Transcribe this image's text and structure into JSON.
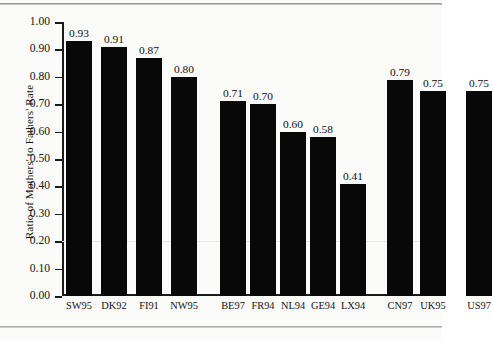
{
  "figure": {
    "ylabel": "Ratio of Mothers' to Fathers' Rate",
    "bar_color": "#080808",
    "axis_color": "#1b1b1b",
    "background": "#fbfbf9"
  },
  "chart_data": {
    "type": "bar",
    "title": "",
    "subtitle": "",
    "xlabel": "",
    "ylabel": "Ratio of Mothers' to Fathers' Rate",
    "ylim": [
      0.0,
      1.0
    ],
    "ytick_labels": [
      "1.00",
      "0.90",
      "0.80",
      "0.70",
      "0.60",
      "0.50",
      "0.40",
      "0.30",
      "0.20",
      "0.10",
      "0.00"
    ],
    "ytick_values": [
      1.0,
      0.9,
      0.8,
      0.7,
      0.6,
      0.5,
      0.4,
      0.3,
      0.2,
      0.1,
      0.0
    ],
    "grid": false,
    "legend": "none",
    "categories": [
      "SW95",
      "DK92",
      "FI91",
      "NW95",
      "BE97",
      "FR94",
      "NL94",
      "GE94",
      "LX94",
      "CN97",
      "UK95",
      "US97"
    ],
    "values": [
      0.93,
      0.91,
      0.87,
      0.8,
      0.71,
      0.7,
      0.6,
      0.58,
      0.41,
      0.79,
      0.75,
      0.75
    ],
    "value_labels": [
      "0.93",
      "0.91",
      "0.87",
      "0.80",
      "0.71",
      "0.70",
      "0.60",
      "0.58",
      "0.41",
      "0.79",
      "0.75",
      "0.75"
    ],
    "groups": [
      {
        "name": "nordic",
        "members": [
          "SW95",
          "DK92",
          "FI91",
          "NW95"
        ]
      },
      {
        "name": "continental",
        "members": [
          "BE97",
          "FR94",
          "NL94",
          "GE94",
          "LX94"
        ]
      },
      {
        "name": "anglo",
        "members": [
          "CN97",
          "UK95",
          "US97"
        ]
      }
    ],
    "bars": [
      {
        "category": "SW95",
        "value": 0.93,
        "label": "0.93",
        "x": 4,
        "width": 26
      },
      {
        "category": "DK92",
        "value": 0.91,
        "label": "0.91",
        "x": 39,
        "width": 26
      },
      {
        "category": "FI91",
        "value": 0.87,
        "label": "0.87",
        "x": 74,
        "width": 26
      },
      {
        "category": "NW95",
        "value": 0.8,
        "label": "0.80",
        "x": 109,
        "width": 26
      },
      {
        "category": "BE97",
        "value": 0.71,
        "label": "0.71",
        "x": 158,
        "width": 26
      },
      {
        "category": "FR94",
        "value": 0.7,
        "label": "0.70",
        "x": 188,
        "width": 26
      },
      {
        "category": "NL94",
        "value": 0.6,
        "label": "0.60",
        "x": 218,
        "width": 26
      },
      {
        "category": "GE94",
        "value": 0.58,
        "label": "0.58",
        "x": 248,
        "width": 26
      },
      {
        "category": "LX94",
        "value": 0.41,
        "label": "0.41",
        "x": 278,
        "width": 26
      },
      {
        "category": "CN97",
        "value": 0.79,
        "label": "0.79",
        "x": 325,
        "width": 26
      },
      {
        "category": "UK95",
        "value": 0.75,
        "label": "0.75",
        "x": 358,
        "width": 26
      },
      {
        "category": "US97",
        "value": 0.75,
        "label": "0.75",
        "x": 404,
        "width": 26
      }
    ]
  }
}
